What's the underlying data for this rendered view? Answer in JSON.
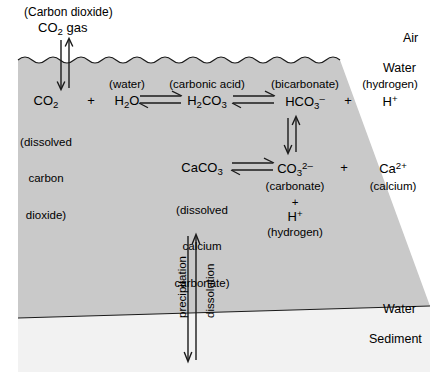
{
  "figure": {
    "colors": {
      "air": "#ffffff",
      "water": "#c9c9c9",
      "sediment": "#f2f2f2",
      "line": "#1a1a1a",
      "text": "#000000"
    }
  },
  "regions": {
    "air_label": "Air",
    "water_label_top": "Water",
    "water_label_bottom": "Water",
    "sediment_label": "Sediment"
  },
  "header": {
    "name": "(Carbon dioxide)",
    "formula_prefix": "CO",
    "formula_sub": "2",
    "formula_suffix": " gas"
  },
  "reaction_top": {
    "co2": {
      "formula_prefix": "CO",
      "formula_sub": "2",
      "name_line1": "(dissolved",
      "name_line2": "carbon",
      "name_line3": "dioxide)"
    },
    "plus_1": "+",
    "h2o": {
      "name": "(water)",
      "formula_a": "H",
      "formula_sub_a": "2",
      "formula_b": "O"
    },
    "h2co3": {
      "name": "(carbonic acid)",
      "formula_a": "H",
      "formula_sub_a": "2",
      "formula_b": "CO",
      "formula_sub_b": "3"
    },
    "hco3": {
      "name": "(bicarbonate)",
      "formula_a": "HCO",
      "formula_sub_a": "3",
      "formula_sup_a": "–"
    },
    "plus_2": "+",
    "hplus": {
      "name": "(hydrogen)",
      "formula_a": "H",
      "formula_sup_a": "+"
    }
  },
  "reaction_bottom": {
    "caco3": {
      "formula_a": "CaCO",
      "formula_sub_a": "3",
      "name_line1": "(dissolved",
      "name_line2": "calcium",
      "name_line3": "carbonate)"
    },
    "co3": {
      "formula_a": "CO",
      "formula_sub_a": "3",
      "formula_sup_a": "2–",
      "name": "(carbonate)",
      "plus": "+",
      "hplus_a": "H",
      "hplus_sup": "+",
      "hplus_name": "(hydrogen)"
    },
    "plus_1": "+",
    "ca": {
      "formula_a": "Ca",
      "formula_sup_a": "2+",
      "name": "(calcium)"
    }
  },
  "vertical_process": {
    "precipitation": "precipitation",
    "dissolution": "dissolution"
  }
}
